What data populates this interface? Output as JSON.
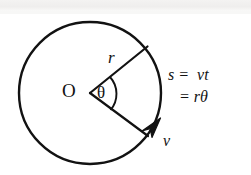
{
  "figure": {
    "type": "physics-diagram",
    "background_color": "#ffffff",
    "stroke_color": "#121212"
  },
  "labels": {
    "center": "O",
    "radius": "r",
    "angle": "θ",
    "velocity": "v"
  },
  "equation": {
    "line1": "s =  vt",
    "line2": "= rθ"
  },
  "geometry": {
    "circle": {
      "cx": 90,
      "cy": 93,
      "r": 71
    },
    "radius_upper_end": {
      "x": 147,
      "y": 47
    },
    "radius_lower_end": {
      "x": 147,
      "y": 136
    },
    "angle_arc_radius": 24,
    "arrow_direction": "tangential-up-right"
  }
}
